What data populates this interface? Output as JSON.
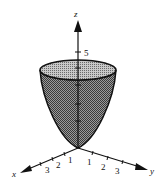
{
  "figure": {
    "surface_color": "#7a7a7a",
    "top_color": "#a8a8a8",
    "axes": {
      "z": {
        "label": "z",
        "ticks": [
          "5"
        ]
      },
      "x": {
        "label": "x",
        "ticks": [
          "1",
          "2",
          "3"
        ]
      },
      "y": {
        "label": "y",
        "ticks": [
          "1",
          "2",
          "3"
        ]
      }
    }
  }
}
